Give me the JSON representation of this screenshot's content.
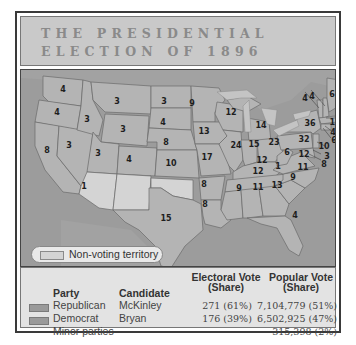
{
  "title": {
    "line1": "THE PRESIDENTIAL",
    "line2": "ELECTION OF 1896"
  },
  "map": {
    "legend": {
      "swatch_label": "Non-voting territory"
    },
    "colors": {
      "water": "#9c9c9c",
      "republican": "#b4b4b4",
      "democrat": "#a6a6a6",
      "non_voting": "#d4d4d4",
      "lakes": "#c4c4c4"
    },
    "states": [
      {
        "name": "WA",
        "votes": "4"
      },
      {
        "name": "OR",
        "votes": "4"
      },
      {
        "name": "CA",
        "votes": "8"
      },
      {
        "name": "NV",
        "votes": "3"
      },
      {
        "name": "ID",
        "votes": "3"
      },
      {
        "name": "MT",
        "votes": "3"
      },
      {
        "name": "WY",
        "votes": "3"
      },
      {
        "name": "UT",
        "votes": "3"
      },
      {
        "name": "CO",
        "votes": "4"
      },
      {
        "name": "ND",
        "votes": "3"
      },
      {
        "name": "SD",
        "votes": "4"
      },
      {
        "name": "NE",
        "votes": "8"
      },
      {
        "name": "KS",
        "votes": "10"
      },
      {
        "name": "TX",
        "votes": "15"
      },
      {
        "name": "MN",
        "votes": "9"
      },
      {
        "name": "IA",
        "votes": "13"
      },
      {
        "name": "MO",
        "votes": "17"
      },
      {
        "name": "AR",
        "votes": "8"
      },
      {
        "name": "LA",
        "votes": "8"
      },
      {
        "name": "WI",
        "votes": "12"
      },
      {
        "name": "IL",
        "votes": "24"
      },
      {
        "name": "MI",
        "votes": "14"
      },
      {
        "name": "IN",
        "votes": "15"
      },
      {
        "name": "OH",
        "votes": "23"
      },
      {
        "name": "KY",
        "votes": "12"
      },
      {
        "name": "TN",
        "votes": "12"
      },
      {
        "name": "MS",
        "votes": "9"
      },
      {
        "name": "AL",
        "votes": "11"
      },
      {
        "name": "GA",
        "votes": "13"
      },
      {
        "name": "FL",
        "votes": "4"
      },
      {
        "name": "SC",
        "votes": "9"
      },
      {
        "name": "NC",
        "votes": "11"
      },
      {
        "name": "VA",
        "votes": "12"
      },
      {
        "name": "WV",
        "votes": "6"
      },
      {
        "name": "PA",
        "votes": "32"
      },
      {
        "name": "NY",
        "votes": "36"
      },
      {
        "name": "VT",
        "votes": "4"
      },
      {
        "name": "NH",
        "votes": "4"
      },
      {
        "name": "ME",
        "votes": "6"
      },
      {
        "name": "MA",
        "votes": "15"
      },
      {
        "name": "RI",
        "votes": "4"
      },
      {
        "name": "CT",
        "votes": "6"
      },
      {
        "name": "NJ",
        "votes": "10"
      },
      {
        "name": "DE",
        "votes": "3"
      },
      {
        "name": "MD",
        "votes": "8"
      },
      {
        "name": "CA-split",
        "votes": "1"
      },
      {
        "name": "KY-split",
        "votes": "1"
      }
    ]
  },
  "results": {
    "headers": {
      "party": "Party",
      "candidate": "Candidate",
      "electoral_line1": "Electoral Vote",
      "electoral_line2": "(Share)",
      "popular_line1": "Popular Vote",
      "popular_line2": "(Share)"
    },
    "rows": [
      {
        "party": "Republican",
        "candidate": "McKinley",
        "electoral": "271 (61%)",
        "popular": "7,104,779 (51%)"
      },
      {
        "party": "Democrat",
        "candidate": "Bryan",
        "electoral": "176 (39%)",
        "popular": "6,502,925 (47%)"
      },
      {
        "party": "Minor parties",
        "candidate": "",
        "electoral": "",
        "popular": "315,398 (2%)"
      }
    ]
  }
}
